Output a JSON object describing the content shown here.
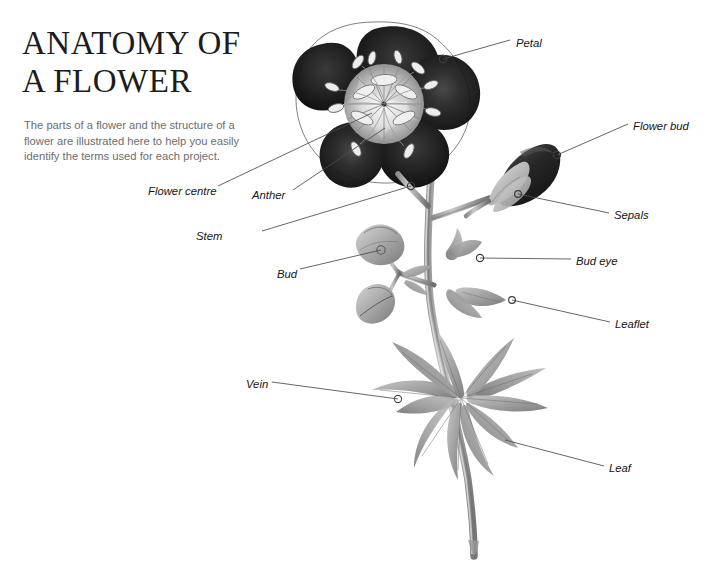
{
  "page": {
    "title": "ANATOMY OF\nA FLOWER",
    "intro": "The parts of a flower and the structure of a flower are illustrated here to help you easily identify the terms used for each project.",
    "background_color": "#ffffff",
    "title_color": "#1c1c1c",
    "intro_color": "#6d6d6d",
    "leader_line_color": "#4a4a4a"
  },
  "diagram": {
    "labels": [
      {
        "id": "petal",
        "text": "Petal",
        "x": 516,
        "y": 44,
        "anchor": "left",
        "marker_x": 443,
        "marker_y": 59
      },
      {
        "id": "flower-bud",
        "text": "Flower bud",
        "x": 633,
        "y": 128,
        "anchor": "left",
        "marker_x": 557,
        "marker_y": 155
      },
      {
        "id": "sepals",
        "text": "Sepals",
        "x": 614,
        "y": 217,
        "anchor": "left",
        "marker_x": 518,
        "marker_y": 194
      },
      {
        "id": "bud-eye",
        "text": "Bud eye",
        "x": 576,
        "y": 263,
        "anchor": "left",
        "marker_x": 480,
        "marker_y": 258
      },
      {
        "id": "leaflet",
        "text": "Leaflet",
        "x": 615,
        "y": 326,
        "anchor": "left",
        "marker_x": 512,
        "marker_y": 300
      },
      {
        "id": "leaf",
        "text": "Leaf",
        "x": 609,
        "y": 470,
        "anchor": "left",
        "marker_x": 505,
        "marker_y": 440
      },
      {
        "id": "flower-centre",
        "text": "Flower centre",
        "x": 148,
        "y": 193,
        "anchor": "right",
        "marker_x": 372,
        "marker_y": 113
      },
      {
        "id": "anther",
        "text": "Anther",
        "x": 252,
        "y": 197,
        "anchor": "right",
        "marker_x": 385,
        "marker_y": 128
      },
      {
        "id": "stem",
        "text": "Stem",
        "x": 196,
        "y": 238,
        "anchor": "right",
        "marker_x": 411,
        "marker_y": 186
      },
      {
        "id": "bud",
        "text": "Bud",
        "x": 277,
        "y": 276,
        "anchor": "right",
        "marker_x": 381,
        "marker_y": 250
      },
      {
        "id": "vein",
        "text": "Vein",
        "x": 246,
        "y": 386,
        "anchor": "right",
        "marker_x": 398,
        "marker_y": 399
      }
    ]
  }
}
